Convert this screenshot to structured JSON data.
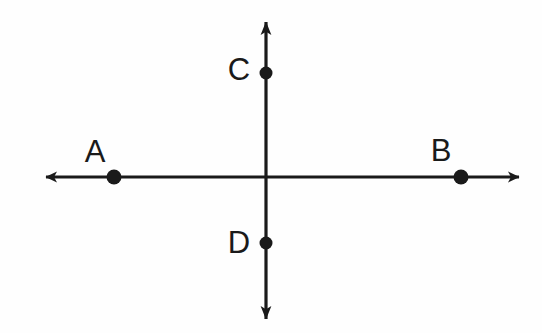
{
  "figure": {
    "background_color": "#fefefe",
    "stroke_color": "#1a1a1a",
    "stroke_width": 3,
    "width": 542,
    "height": 333
  },
  "lines": {
    "horizontal": {
      "name": "horizontal-line-AB",
      "y": 177,
      "x_start": 46,
      "x_end": 519,
      "arrow_left_tip_x": 43,
      "arrow_right_tip_x": 522,
      "double_headed": true
    },
    "vertical": {
      "name": "vertical-line-CD",
      "x": 266,
      "y_start": 21,
      "y_end": 320,
      "arrow_top_tip_y": 18,
      "arrow_bottom_tip_y": 323,
      "double_headed": true
    },
    "intersection": {
      "x": 266,
      "y": 177
    }
  },
  "points": [
    {
      "id": "A",
      "label": "A",
      "cx": 114,
      "cy": 177,
      "r": 7.5,
      "label_x": 95,
      "label_y": 162,
      "on_line": "horizontal"
    },
    {
      "id": "B",
      "label": "B",
      "cx": 461,
      "cy": 177,
      "r": 7.5,
      "label_x": 441,
      "label_y": 161,
      "on_line": "horizontal"
    },
    {
      "id": "C",
      "label": "C",
      "cx": 266,
      "cy": 73,
      "r": 6.5,
      "label_x": 239,
      "label_y": 80,
      "on_line": "vertical"
    },
    {
      "id": "D",
      "label": "D",
      "cx": 266,
      "cy": 243,
      "r": 6.5,
      "label_x": 239,
      "label_y": 253,
      "on_line": "vertical"
    }
  ],
  "colors": {
    "ink": "#1a1a1a",
    "paper": "#fefefe"
  }
}
